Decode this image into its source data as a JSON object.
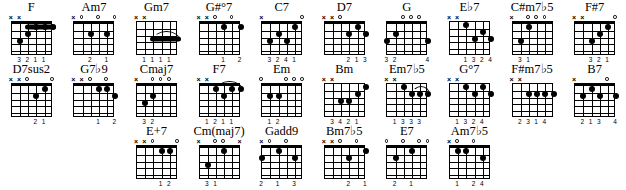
{
  "page": {
    "columns": 10,
    "rows": 3
  },
  "legend": {
    "muted_symbol": "x",
    "open_symbol": "o",
    "strings": 6,
    "frets": 5
  },
  "rows": [
    {
      "row_index": 1,
      "chords": [
        {
          "name": "F",
          "markers": [
            "x",
            "x",
            "",
            "",
            "",
            ""
          ],
          "nut": true,
          "barre": {
            "from_string": 3,
            "to_string": 6,
            "fret": 1
          },
          "dots": [
            {
              "string": 2,
              "fret": 3
            },
            {
              "string": 3,
              "fret": 2
            },
            {
              "string": 4,
              "fret": 1
            },
            {
              "string": 5,
              "fret": 1
            },
            {
              "string": 6,
              "fret": 1
            }
          ],
          "fingers": [
            "",
            "3",
            "2",
            "1",
            "1",
            ""
          ]
        },
        {
          "name": "Am7",
          "markers": [
            "x",
            "o",
            "",
            "o",
            "",
            "o"
          ],
          "nut": true,
          "dots": [
            {
              "string": 3,
              "fret": 2
            },
            {
              "string": 5,
              "fret": 2
            }
          ],
          "fingers": [
            "",
            "",
            "2",
            "",
            "1",
            ""
          ]
        },
        {
          "name": "Gm7",
          "markers": [
            "x",
            "x",
            "",
            "",
            "",
            ""
          ],
          "nut": false,
          "barre": {
            "from_string": 3,
            "to_string": 6,
            "fret": 3
          },
          "arc": {
            "from_string": 3,
            "to_string": 6,
            "fret": 3
          },
          "dots": [],
          "fingers": [
            "",
            "1",
            "1",
            "1",
            "1",
            ""
          ]
        },
        {
          "name": "G#°7",
          "markers": [
            "x",
            "x",
            "o",
            "",
            "o",
            ""
          ],
          "nut": true,
          "dots": [
            {
              "string": 4,
              "fret": 1
            },
            {
              "string": 6,
              "fret": 1
            }
          ],
          "fingers": [
            "",
            "",
            "",
            "1",
            "",
            "2"
          ]
        },
        {
          "name": "C7",
          "markers": [
            "x",
            "",
            "",
            "",
            "",
            "o"
          ],
          "nut": true,
          "dots": [
            {
              "string": 2,
              "fret": 3
            },
            {
              "string": 3,
              "fret": 2
            },
            {
              "string": 4,
              "fret": 3
            },
            {
              "string": 5,
              "fret": 1
            }
          ],
          "fingers": [
            "",
            "3",
            "2",
            "4",
            "1",
            ""
          ]
        },
        {
          "name": "D7",
          "markers": [
            "x",
            "x",
            "o",
            "",
            "",
            ""
          ],
          "nut": true,
          "dots": [
            {
              "string": 4,
              "fret": 2
            },
            {
              "string": 5,
              "fret": 1
            },
            {
              "string": 6,
              "fret": 2
            }
          ],
          "fingers": [
            "",
            "",
            "",
            "2",
            "1",
            "3"
          ]
        },
        {
          "name": "G",
          "markers": [
            "",
            "",
            "o",
            "o",
            "o",
            ""
          ],
          "nut": true,
          "dots": [
            {
              "string": 1,
              "fret": 3
            },
            {
              "string": 2,
              "fret": 2
            },
            {
              "string": 6,
              "fret": 3
            }
          ],
          "fingers": [
            "3",
            "2",
            "",
            "",
            "",
            "4"
          ]
        },
        {
          "name": "E♭7",
          "markers": [
            "x",
            "x",
            "",
            "",
            "",
            ""
          ],
          "nut": false,
          "dots": [
            {
              "string": 3,
              "fret": 1
            },
            {
              "string": 4,
              "fret": 3
            },
            {
              "string": 5,
              "fret": 2
            },
            {
              "string": 6,
              "fret": 3
            }
          ],
          "fingers": [
            "",
            "",
            "1",
            "3",
            "2",
            "4"
          ]
        },
        {
          "name": "C#m7♭5",
          "markers": [
            "x",
            "",
            "o",
            "o",
            "o",
            ""
          ],
          "nut": true,
          "dots": [
            {
              "string": 2,
              "fret": 3
            },
            {
              "string": 3,
              "fret": 1
            }
          ],
          "fingers": [
            "",
            "3",
            "1",
            "",
            "",
            ""
          ]
        },
        {
          "name": "F#7",
          "markers": [
            "x",
            "x",
            "",
            "",
            "",
            "o"
          ],
          "nut": true,
          "dots": [
            {
              "string": 3,
              "fret": 3
            },
            {
              "string": 4,
              "fret": 2
            },
            {
              "string": 5,
              "fret": 1
            }
          ],
          "fingers": [
            "",
            "",
            "3",
            "2",
            "1",
            ""
          ]
        }
      ]
    },
    {
      "row_index": 2,
      "chords": [
        {
          "name": "D7sus2",
          "markers": [
            "x",
            "x",
            "o",
            "",
            "",
            "o"
          ],
          "nut": true,
          "dots": [
            {
              "string": 4,
              "fret": 2
            },
            {
              "string": 5,
              "fret": 1
            }
          ],
          "fingers": [
            "",
            "",
            "",
            "2",
            "1",
            ""
          ]
        },
        {
          "name": "G7♭9",
          "markers": [
            "x",
            "x",
            "o",
            "",
            "o",
            ""
          ],
          "nut": true,
          "dots": [
            {
              "string": 4,
              "fret": 1
            },
            {
              "string": 5,
              "fret": 1
            },
            {
              "string": 6,
              "fret": 2
            }
          ],
          "fingers": [
            "",
            "",
            "",
            "1",
            "",
            "2"
          ]
        },
        {
          "name": "Cmaj7",
          "markers": [
            "x",
            "",
            "o",
            "o",
            "o",
            ""
          ],
          "nut": true,
          "dots": [
            {
              "string": 2,
              "fret": 3
            },
            {
              "string": 3,
              "fret": 2
            }
          ],
          "fingers": [
            "",
            "3",
            "2",
            "",
            "",
            ""
          ]
        },
        {
          "name": "F7",
          "markers": [
            "x",
            "x",
            "",
            "",
            "",
            ""
          ],
          "nut": true,
          "arc": {
            "from_string": 3,
            "to_string": 6,
            "fret": 1
          },
          "dots": [
            {
              "string": 3,
              "fret": 1
            },
            {
              "string": 4,
              "fret": 2
            },
            {
              "string": 5,
              "fret": 1
            },
            {
              "string": 6,
              "fret": 1
            }
          ],
          "fingers": [
            "",
            "1",
            "2",
            "1",
            "1",
            ""
          ]
        },
        {
          "name": "Em",
          "markers": [
            "o",
            "",
            "",
            "o",
            "o",
            "o"
          ],
          "nut": true,
          "dots": [
            {
              "string": 2,
              "fret": 2
            },
            {
              "string": 3,
              "fret": 2
            }
          ],
          "fingers": [
            "",
            "1",
            "2",
            "",
            "",
            ""
          ]
        },
        {
          "name": "Bm",
          "markers": [
            "x",
            "x",
            "",
            "",
            "",
            ""
          ],
          "nut": false,
          "dots": [
            {
              "string": 3,
              "fret": 3
            },
            {
              "string": 4,
              "fret": 3
            },
            {
              "string": 5,
              "fret": 2
            },
            {
              "string": 6,
              "fret": 1
            }
          ],
          "fingers": [
            "",
            "3",
            "4",
            "2",
            "1",
            ""
          ]
        },
        {
          "name": "Em7♭5",
          "markers": [
            "x",
            "x",
            "",
            "",
            "",
            ""
          ],
          "nut": false,
          "arc": {
            "from_string": 4,
            "to_string": 6,
            "fret": 2
          },
          "dots": [
            {
              "string": 3,
              "fret": 1
            },
            {
              "string": 4,
              "fret": 2
            },
            {
              "string": 5,
              "fret": 2
            },
            {
              "string": 6,
              "fret": 2
            }
          ],
          "fingers": [
            "",
            "1",
            "3",
            "3",
            "3",
            ""
          ]
        },
        {
          "name": "G°7",
          "markers": [
            "x",
            "x",
            "",
            "",
            "",
            ""
          ],
          "nut": false,
          "dots": [
            {
              "string": 3,
              "fret": 1
            },
            {
              "string": 4,
              "fret": 2
            },
            {
              "string": 5,
              "fret": 1
            },
            {
              "string": 6,
              "fret": 2
            }
          ],
          "fingers": [
            "",
            "1",
            "3",
            "2",
            "4",
            ""
          ]
        },
        {
          "name": "F#m7♭5",
          "markers": [
            "x",
            "x",
            "",
            "",
            "",
            ""
          ],
          "nut": false,
          "dots": [
            {
              "string": 3,
              "fret": 2
            },
            {
              "string": 4,
              "fret": 2
            },
            {
              "string": 5,
              "fret": 2
            },
            {
              "string": 6,
              "fret": 2
            }
          ],
          "fingers": [
            "",
            "2",
            "3",
            "1",
            "4",
            ""
          ]
        },
        {
          "name": "B7",
          "markers": [
            "x",
            "",
            "",
            "",
            "o",
            ""
          ],
          "nut": true,
          "dots": [
            {
              "string": 2,
              "fret": 2
            },
            {
              "string": 3,
              "fret": 1
            },
            {
              "string": 4,
              "fret": 2
            },
            {
              "string": 6,
              "fret": 2
            }
          ],
          "fingers": [
            "",
            "2",
            "1",
            "3",
            "",
            "4"
          ]
        }
      ]
    },
    {
      "row_index": 3,
      "chords": [
        {
          "name": "E+7",
          "markers": [
            "x",
            "x",
            "o",
            "",
            "",
            "o"
          ],
          "nut": true,
          "dots": [
            {
              "string": 4,
              "fret": 1
            },
            {
              "string": 5,
              "fret": 1
            }
          ],
          "fingers": [
            "",
            "",
            "",
            "1",
            "2",
            ""
          ]
        },
        {
          "name": "Cm(maj7)",
          "markers": [
            "x",
            "",
            "o",
            "o",
            "",
            "x"
          ],
          "nut": true,
          "dots": [
            {
              "string": 2,
              "fret": 3
            },
            {
              "string": 4,
              "fret": 1
            }
          ],
          "fingers": [
            "",
            "3",
            "1",
            "",
            "",
            ""
          ]
        },
        {
          "name": "Gadd9",
          "markers": [
            "x",
            "o",
            "",
            "o",
            "",
            ""
          ],
          "nut": true,
          "dots": [
            {
              "string": 1,
              "fret": 2
            },
            {
              "string": 3,
              "fret": 1
            },
            {
              "string": 5,
              "fret": 2
            }
          ],
          "fingers": [
            "2",
            "",
            "1",
            "",
            "3",
            ""
          ]
        },
        {
          "name": "Bm7♭5",
          "markers": [
            "x",
            "x",
            "o",
            "",
            "o",
            ""
          ],
          "nut": true,
          "dots": [
            {
              "string": 4,
              "fret": 2
            },
            {
              "string": 6,
              "fret": 1
            }
          ],
          "fingers": [
            "",
            "",
            "",
            "2",
            "",
            "1"
          ]
        },
        {
          "name": "E7",
          "markers": [
            "o",
            "",
            "o",
            "",
            "o",
            "o"
          ],
          "nut": true,
          "dots": [
            {
              "string": 2,
              "fret": 2
            },
            {
              "string": 4,
              "fret": 1
            }
          ],
          "fingers": [
            "",
            "2",
            "",
            "1",
            "",
            ""
          ]
        },
        {
          "name": "Am7♭5",
          "markers": [
            "x",
            "o",
            "",
            "o",
            "",
            ""
          ],
          "nut": true,
          "dots": [
            {
              "string": 2,
              "fret": 1
            },
            {
              "string": 3,
              "fret": 1
            },
            {
              "string": 5,
              "fret": 2
            }
          ],
          "fingers": [
            "",
            "1",
            "",
            "2",
            "4",
            ""
          ]
        }
      ]
    }
  ]
}
